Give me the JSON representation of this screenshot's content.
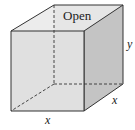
{
  "diagram": {
    "top_label": "Open",
    "height_label": "y",
    "depth_label": "x",
    "width_label": "x",
    "colors": {
      "front_face": "#e2e2e2",
      "side_face": "#c4c4c4",
      "top_opening": "#ececec",
      "edge": "#333333"
    }
  }
}
